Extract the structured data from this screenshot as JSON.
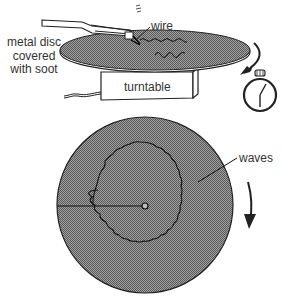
{
  "diagram": {
    "labels": {
      "metal_disc": "metal disc covered with soot",
      "wire": "wire",
      "turntable": "turntable",
      "waves": "waves"
    },
    "components": [
      {
        "name": "tuning-fork",
        "description": "tuning fork with wire attached to one prong"
      },
      {
        "name": "top-disc",
        "description": "metal disc covered with soot on turntable (perspective view)"
      },
      {
        "name": "turntable",
        "description": "turntable box with power cord"
      },
      {
        "name": "rotation-arrow-top",
        "description": "curved arrow showing rotation"
      },
      {
        "name": "stopwatch",
        "description": "stopwatch for timing"
      },
      {
        "name": "bottom-disc",
        "description": "top-down view of sooted disc with wave trace"
      },
      {
        "name": "rotation-arrow-bottom",
        "description": "downward arrow showing rotation direction"
      }
    ],
    "colors": {
      "soot": "#8a8a8a",
      "line": "#1a1a1a",
      "text": "#333333",
      "background": "#ffffff"
    }
  }
}
